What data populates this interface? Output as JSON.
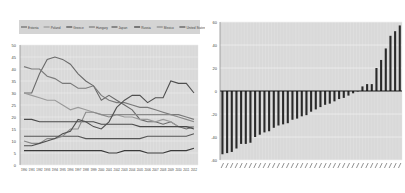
{
  "chart_data": [
    {
      "type": "line",
      "title": "",
      "xlabel": "",
      "ylabel": "",
      "ylim": [
        0,
        50
      ],
      "grid": true,
      "legend_position": "top",
      "categories": [
        "1990",
        "1991",
        "1992",
        "1993",
        "1994",
        "1995",
        "1996",
        "1997",
        "1998",
        "1999",
        "2000",
        "2001",
        "2002",
        "2003",
        "2004",
        "2005",
        "2006",
        "2007",
        "2008",
        "2009",
        "2010",
        "2011",
        "2012"
      ],
      "y_ticks": [
        "50",
        "45",
        "40",
        "35",
        "30",
        "25",
        "20",
        "15",
        "10",
        "5",
        "0"
      ],
      "series": [
        {
          "name": "Estonia",
          "color": "#6a6a6a",
          "values": [
            30,
            30,
            38,
            44,
            45,
            44,
            42,
            38,
            35,
            33,
            27,
            29,
            27,
            25,
            23,
            19,
            18,
            18,
            17,
            18,
            16,
            15,
            16
          ]
        },
        {
          "name": "Poland",
          "color": "#9a9a9a",
          "values": [
            30,
            29,
            28,
            27,
            27,
            25,
            23,
            24,
            23,
            22,
            21,
            21,
            21,
            20,
            20,
            19,
            19,
            18,
            19,
            18,
            16,
            16,
            16
          ]
        },
        {
          "name": "Greece",
          "color": "#4a4a4a",
          "values": [
            19,
            19,
            18,
            18,
            18,
            18,
            18,
            18,
            18,
            18,
            17,
            17,
            17,
            17,
            17,
            16,
            16,
            16,
            16,
            16,
            16,
            16,
            15
          ]
        },
        {
          "name": "Hungary",
          "color": "#7a7a7a",
          "values": [
            41,
            40,
            40,
            37,
            36,
            34,
            34,
            32,
            32,
            33,
            29,
            27,
            26,
            26,
            25,
            24,
            24,
            23,
            22,
            21,
            21,
            20,
            19
          ]
        },
        {
          "name": "Japan",
          "color": "#555555",
          "values": [
            12,
            12,
            12,
            12,
            12,
            12,
            12,
            12,
            11,
            11,
            11,
            11,
            11,
            11,
            11,
            11,
            12,
            12,
            12,
            12,
            12,
            12,
            13
          ]
        },
        {
          "name": "Russia",
          "color": "#3a3a3a",
          "values": [
            6,
            6,
            6,
            6,
            6,
            6,
            6,
            6,
            6,
            6,
            6,
            5,
            5,
            6,
            6,
            6,
            5,
            5,
            5,
            6,
            6,
            6,
            7
          ]
        },
        {
          "name": "Mexico",
          "color": "#8a8a8a",
          "values": [
            10,
            9,
            9,
            11,
            11,
            12,
            15,
            15,
            22,
            22,
            21,
            20,
            21,
            21,
            21,
            21,
            21,
            21,
            21,
            21,
            20,
            19,
            18
          ]
        },
        {
          "name": "United States",
          "color": "#505050",
          "values": [
            8,
            8,
            9,
            10,
            11,
            13,
            14,
            19,
            18,
            16,
            15,
            18,
            24,
            27,
            29,
            29,
            26,
            28,
            28,
            35,
            34,
            34,
            30
          ]
        }
      ]
    },
    {
      "type": "bar",
      "title": "",
      "xlabel": "",
      "ylabel": "",
      "ylim": [
        -60,
        60
      ],
      "grid": true,
      "y_ticks": [
        "60",
        "40",
        "20",
        "0",
        "-20",
        "-40",
        "-60"
      ],
      "categories": [
        "",
        "",
        "",
        "",
        "",
        "",
        "",
        "",
        "",
        "",
        "",
        "",
        "",
        "",
        "",
        "",
        "",
        "",
        "",
        "",
        "",
        "",
        "",
        "",
        "",
        "",
        "",
        "",
        "",
        "",
        "",
        "",
        "",
        ""
      ],
      "values": [
        -55,
        -54,
        -53,
        -50,
        -46,
        -46,
        -45,
        -40,
        -38,
        -36,
        -35,
        -32,
        -30,
        -29,
        -28,
        -25,
        -24,
        -22,
        -21,
        -18,
        -16,
        -14,
        -12,
        -11,
        -9,
        -7,
        -6,
        -4,
        -2,
        0,
        4,
        6,
        6,
        20,
        27,
        37,
        48,
        52,
        57
      ]
    }
  ],
  "legend": [
    "Estonia",
    "Poland",
    "Greece",
    "Hungary",
    "Japan",
    "Russia",
    "Mexico",
    "United States"
  ]
}
